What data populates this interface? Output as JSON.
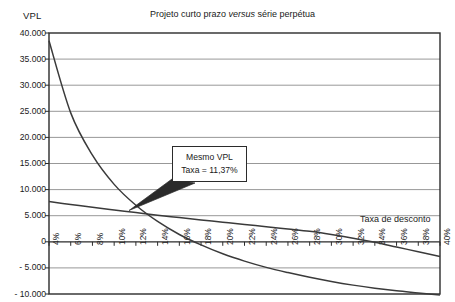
{
  "chart_data": {
    "type": "line",
    "title": "Projeto curto prazo versus série perpétua",
    "title_plain": "Projeto curto prazo ",
    "title_italic": "versus",
    "title_tail": " série perpétua",
    "ylabel": "VPL",
    "xlabel": "Taxa de desconto",
    "grid": true,
    "legend": "none",
    "xlim": [
      4,
      40
    ],
    "ylim": [
      -10000,
      40000
    ],
    "x_tick_step": 2,
    "y_tick_step": 5000,
    "categories": [
      "4%",
      "6%",
      "8%",
      "10%",
      "12%",
      "14%",
      "16%",
      "18%",
      "20%",
      "22%",
      "24%",
      "26%",
      "28%",
      "30%",
      "32%",
      "34%",
      "36%",
      "38%",
      "40%"
    ],
    "ytick_labels": [
      "40.000",
      "35.000",
      "30.000",
      "25.000",
      "20.000",
      "15.000",
      "10.000",
      "5.000",
      "0",
      "- 5.000",
      "- 10.000"
    ],
    "ytick_values": [
      40000,
      35000,
      30000,
      25000,
      20000,
      15000,
      10000,
      5000,
      0,
      -5000,
      -10000
    ],
    "x": [
      4,
      6,
      8,
      10,
      12,
      14,
      16,
      18,
      20,
      22,
      24,
      26,
      28,
      30,
      32,
      34,
      36,
      38,
      40
    ],
    "series": [
      {
        "name": "Série perpétua",
        "values": [
          38500,
          24700,
          16600,
          11000,
          7000,
          3900,
          1400,
          -600,
          -2300,
          -3700,
          -4900,
          -5900,
          -6800,
          -7600,
          -8300,
          -8900,
          -9400,
          -9800,
          -10200
        ]
      },
      {
        "name": "Projeto curto prazo",
        "values": [
          7700,
          7150,
          6600,
          6100,
          5600,
          5100,
          4650,
          4200,
          3750,
          3300,
          2900,
          2450,
          2000,
          1400,
          700,
          -100,
          -1000,
          -1900,
          -2800
        ]
      }
    ],
    "annotations": [
      {
        "name": "intersection-callout",
        "line1": "Mesmo VPL",
        "line2": "Taxa = 11,37%",
        "point_x": 11.37,
        "point_y": 6000
      }
    ],
    "colors": {
      "axis": "#2b2b2b",
      "grid": "#8c8c8c",
      "series": "#3a3a3a",
      "text": "#1a1a1a",
      "background": "#ffffff"
    }
  }
}
